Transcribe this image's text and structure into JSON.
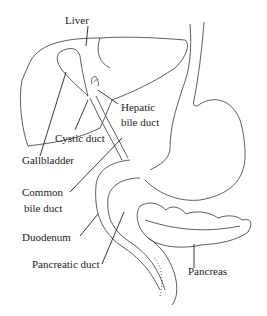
{
  "diagram": {
    "labels": {
      "liver": "Liver",
      "hepatic_line1": "Hepatic",
      "hepatic_line2": "bile duct",
      "cystic_duct": "Cystic duct",
      "gallbladder": "Gallbladder",
      "common_line1": "Common",
      "common_line2": "bile duct",
      "duodenum": "Duodenum",
      "pancreatic_duct": "Pancreatic duct",
      "pancreas": "Pancreas"
    },
    "colors": {
      "stroke": "#333333",
      "text": "#222222",
      "background": "#ffffff"
    }
  }
}
